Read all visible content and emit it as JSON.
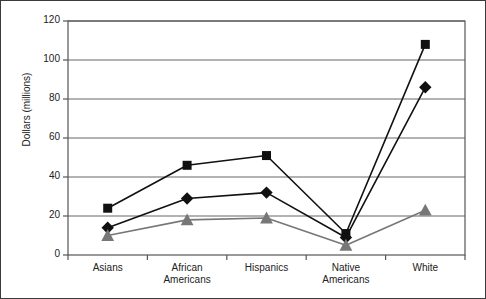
{
  "chart_data": {
    "type": "line",
    "title": "",
    "subtitle": "",
    "xlabel": "",
    "ylabel": "Dollars (millions)",
    "categories": [
      "Asians",
      "African\nAmericans",
      "Hispanics",
      "Native\nAmericans",
      "White"
    ],
    "category_labels_flat": [
      "Asians",
      "African Americans",
      "Hispanics",
      "Native Americans",
      "White"
    ],
    "ylim": [
      0,
      120
    ],
    "yticks": [
      0,
      20,
      40,
      60,
      80,
      100,
      120
    ],
    "ytick_labels": [
      "0",
      "20",
      "40",
      "60",
      "80",
      "100",
      "120"
    ],
    "grid": true,
    "grid_axis": "y",
    "legend": false,
    "legend_position": "none",
    "series": [
      {
        "name": "Series 1",
        "marker": "square",
        "color": "#111111",
        "line_color": "#111111",
        "values": [
          24,
          46,
          51,
          11,
          108
        ]
      },
      {
        "name": "Series 2",
        "marker": "diamond",
        "color": "#111111",
        "line_color": "#111111",
        "values": [
          14,
          29,
          32,
          9,
          86
        ]
      },
      {
        "name": "Series 3",
        "marker": "triangle",
        "color": "#777777",
        "line_color": "#777777",
        "values": [
          10,
          18,
          19,
          5,
          23
        ]
      }
    ],
    "colors": {
      "axis": "#555555",
      "grid": "#666666",
      "frame": "#3a3a3a",
      "background": "#ffffff",
      "series_dark": "#111111",
      "series_gray": "#777777"
    }
  }
}
